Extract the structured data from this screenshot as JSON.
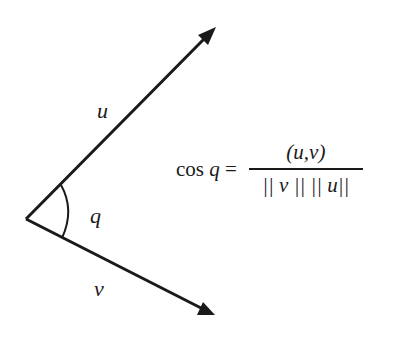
{
  "diagram": {
    "vectors": [
      {
        "name": "u",
        "label": "u",
        "from": [
          26,
          219
        ],
        "to": [
          216,
          27
        ]
      },
      {
        "name": "v",
        "label": "v",
        "from": [
          26,
          219
        ],
        "to": [
          215,
          315
        ]
      }
    ],
    "angle": {
      "label": "q"
    },
    "formula": {
      "lhs_func": "cos",
      "lhs_var": "q",
      "equals": "=",
      "numerator": "(u,v)",
      "denominator": "|| v || || u||"
    },
    "color": "#1a1a1a"
  }
}
